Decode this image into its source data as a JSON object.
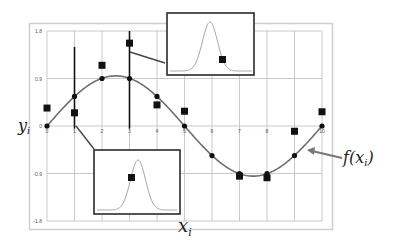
{
  "chart_data": {
    "type": "scatter",
    "title": "",
    "xlabel": "x_i",
    "ylabel": "y_i",
    "curve_label": "f(x_i)",
    "xlim": [
      0,
      10
    ],
    "ylim": [
      -1.8,
      1.8
    ],
    "x_ticks": [
      "0",
      "1",
      "2",
      "3",
      "4",
      "5",
      "6",
      "7",
      "8",
      "9",
      "10"
    ],
    "y_ticks": [
      "1.8",
      "0.9",
      "0",
      "-0.9",
      "-1.8"
    ],
    "grid": true,
    "series": [
      {
        "name": "f(x_i)",
        "kind": "line-with-markers",
        "x": [
          0,
          1,
          2,
          3,
          4,
          5,
          6,
          7,
          8,
          9,
          10
        ],
        "values": [
          0.0,
          0.56,
          0.9,
          0.9,
          0.56,
          0.0,
          -0.56,
          -0.9,
          -0.9,
          -0.56,
          0.0
        ]
      },
      {
        "name": "y_i (observations)",
        "kind": "square-markers",
        "x": [
          0,
          1,
          2,
          3,
          4,
          5,
          7,
          8,
          9,
          10
        ],
        "values": [
          0.34,
          0.25,
          1.15,
          1.57,
          0.4,
          0.28,
          -0.95,
          -0.98,
          -0.1,
          0.27
        ]
      }
    ],
    "error_bars": [
      {
        "x": 1,
        "low": -0.05,
        "high": 1.5
      },
      {
        "x": 3,
        "low": -0.05,
        "high": 1.8
      }
    ],
    "insets": [
      {
        "anchor_x": 3,
        "description": "Gaussian likelihood at x=3 with observation on right tail"
      },
      {
        "anchor_x": 1,
        "description": "Gaussian likelihood at x=1 with observation left of peak"
      }
    ]
  },
  "labels": {
    "y_axis": "y",
    "y_axis_sub": "i",
    "x_axis": "x",
    "x_axis_sub": "i",
    "curve_f": "f(x",
    "curve_sub": "i",
    "curve_close": ")"
  },
  "colors": {
    "grid": "#bdbdbd",
    "frame": "#cfcfcf",
    "curve": "#6e6e6e",
    "marker": "#111111",
    "inset_border": "#2a2a2a",
    "arrow": "#777777"
  }
}
